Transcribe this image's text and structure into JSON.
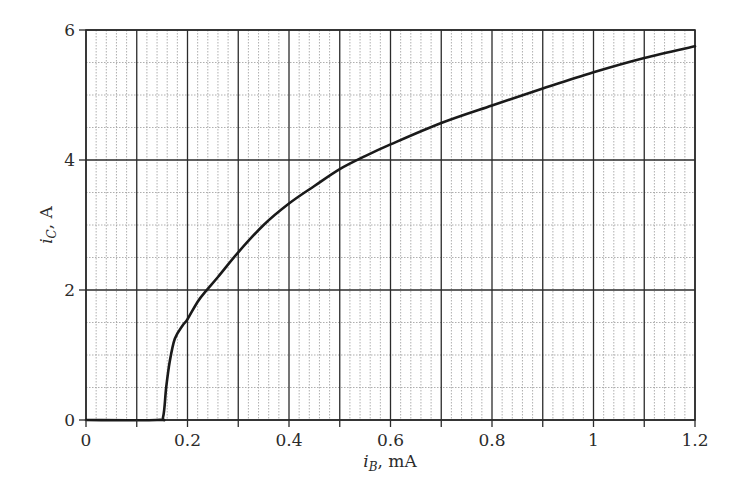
{
  "chart_data": {
    "type": "line",
    "title": "",
    "xlabel": "i_B, mA",
    "ylabel": "i_C, A",
    "xlabel_parts": {
      "var": "i",
      "sub": "B",
      "unit": ", mA"
    },
    "ylabel_parts": {
      "var": "i",
      "sub": "C",
      "unit": ", A"
    },
    "xlim": [
      0,
      1.2
    ],
    "ylim": [
      0,
      6
    ],
    "x_ticks": [
      0,
      0.2,
      0.4,
      0.6,
      0.8,
      1,
      1.2
    ],
    "x_tick_labels": [
      "0",
      "0.2",
      "0.4",
      "0.6",
      "0.8",
      "1",
      "1.2"
    ],
    "y_ticks": [
      0,
      2,
      4,
      6
    ],
    "y_tick_labels": [
      "0",
      "2",
      "4",
      "6"
    ],
    "grid": {
      "major_x_step": 0.1,
      "minor_x_step": 0.02,
      "major_y_step": 2,
      "minor_y_step": 0.5
    },
    "legend": null,
    "series": [
      {
        "name": "i_C vs i_B",
        "x": [
          0,
          0.14,
          0.152,
          0.158,
          0.165,
          0.175,
          0.19,
          0.2,
          0.22,
          0.238,
          0.26,
          0.3,
          0.35,
          0.4,
          0.45,
          0.5,
          0.55,
          0.6,
          0.7,
          0.8,
          0.9,
          1.0,
          1.1,
          1.2
        ],
        "y": [
          0,
          0,
          0.05,
          0.5,
          0.9,
          1.25,
          1.45,
          1.55,
          1.82,
          2.0,
          2.2,
          2.58,
          3.0,
          3.33,
          3.6,
          3.86,
          4.06,
          4.24,
          4.57,
          4.84,
          5.1,
          5.35,
          5.57,
          5.75
        ]
      }
    ]
  },
  "colors": {
    "background": "#ffffff",
    "major_grid": "#2b2b2b",
    "minor_grid": "#9a9a9a",
    "curve": "#1a1a1a",
    "text": "#2b2b2b"
  }
}
